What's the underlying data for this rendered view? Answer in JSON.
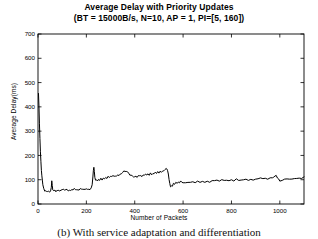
{
  "figure": {
    "title": "Average Delay with Priority Updates",
    "subtitle": "(BT = 15000B/s, N=10, AP = 1, PI=[5, 160])",
    "caption": "(b) With service adaptation and differentiation"
  },
  "chart_data": {
    "type": "line",
    "title": "Average Delay with Priority Updates",
    "subtitle": "(BT = 15000B/s, N=10, AP = 1, PI=[5, 160])",
    "xlabel": "Number of Packets",
    "ylabel": "Average Delay(ms)",
    "xlim": [
      0,
      1100
    ],
    "ylim": [
      0,
      700
    ],
    "xticks": [
      0,
      200,
      400,
      600,
      800,
      1000
    ],
    "xticklabels": [
      "0",
      "200",
      "400",
      "600",
      "800",
      "1000"
    ],
    "yticks": [
      0,
      100,
      200,
      300,
      400,
      500,
      600,
      700
    ],
    "yticklabels": [
      "0",
      "100",
      "200",
      "300",
      "400",
      "500",
      "600",
      "700"
    ],
    "grid": false,
    "legend": null,
    "line_color": "#000000",
    "line_width": 1.0,
    "series": [
      {
        "name": "Average delay",
        "x": [
          2,
          4,
          6,
          8,
          10,
          12,
          14,
          16,
          18,
          20,
          24,
          28,
          32,
          36,
          40,
          44,
          48,
          52,
          55,
          57,
          59,
          61,
          63,
          66,
          70,
          74,
          78,
          82,
          86,
          90,
          95,
          100,
          105,
          110,
          115,
          120,
          125,
          130,
          135,
          140,
          145,
          150,
          155,
          160,
          165,
          170,
          175,
          180,
          185,
          190,
          195,
          200,
          205,
          210,
          215,
          220,
          224,
          227,
          229,
          231,
          233,
          235,
          238,
          242,
          246,
          250,
          255,
          260,
          265,
          270,
          275,
          280,
          285,
          290,
          295,
          300,
          305,
          310,
          315,
          320,
          325,
          330,
          335,
          340,
          345,
          350,
          355,
          360,
          365,
          370,
          375,
          380,
          385,
          390,
          395,
          400,
          405,
          410,
          415,
          420,
          425,
          430,
          435,
          440,
          445,
          450,
          455,
          460,
          465,
          470,
          475,
          480,
          485,
          490,
          495,
          500,
          505,
          510,
          515,
          520,
          525,
          530,
          533,
          536,
          539,
          542,
          545,
          548,
          552,
          556,
          560,
          565,
          570,
          575,
          580,
          585,
          590,
          595,
          600,
          610,
          620,
          630,
          640,
          650,
          660,
          670,
          680,
          690,
          700,
          710,
          720,
          730,
          740,
          750,
          760,
          770,
          780,
          790,
          800,
          810,
          820,
          830,
          840,
          850,
          860,
          870,
          880,
          890,
          900,
          910,
          920,
          930,
          940,
          950,
          960,
          970,
          975,
          980,
          985,
          990,
          995,
          1000,
          1010,
          1020,
          1030,
          1040,
          1050,
          1060,
          1070,
          1080,
          1090,
          1100
        ],
        "y": [
          455,
          400,
          330,
          270,
          215,
          175,
          140,
          115,
          95,
          78,
          62,
          55,
          52,
          50,
          49,
          51,
          50,
          52,
          70,
          95,
          78,
          60,
          54,
          52,
          55,
          53,
          56,
          54,
          57,
          55,
          58,
          56,
          59,
          57,
          60,
          58,
          56,
          59,
          57,
          60,
          58,
          61,
          59,
          57,
          60,
          58,
          61,
          59,
          62,
          60,
          58,
          61,
          63,
          60,
          62,
          65,
          80,
          110,
          140,
          152,
          135,
          110,
          95,
          100,
          98,
          103,
          100,
          105,
          102,
          108,
          105,
          110,
          107,
          112,
          109,
          114,
          111,
          116,
          113,
          118,
          115,
          120,
          117,
          122,
          126,
          130,
          133,
          136,
          134,
          130,
          126,
          122,
          118,
          115,
          112,
          110,
          113,
          111,
          115,
          113,
          117,
          115,
          119,
          117,
          121,
          119,
          123,
          121,
          125,
          123,
          127,
          125,
          129,
          127,
          131,
          129,
          133,
          131,
          136,
          140,
          143,
          145,
          142,
          135,
          120,
          100,
          82,
          72,
          78,
          75,
          85,
          80,
          88,
          84,
          90,
          86,
          92,
          88,
          90,
          87,
          91,
          88,
          92,
          89,
          93,
          90,
          94,
          91,
          95,
          92,
          96,
          93,
          97,
          94,
          98,
          95,
          99,
          96,
          100,
          97,
          101,
          98,
          102,
          99,
          103,
          100,
          104,
          101,
          105,
          102,
          106,
          103,
          107,
          104,
          108,
          105,
          112,
          118,
          115,
          108,
          100,
          96,
          99,
          102,
          100,
          104,
          101,
          106,
          103,
          108,
          105,
          110
        ]
      }
    ]
  }
}
